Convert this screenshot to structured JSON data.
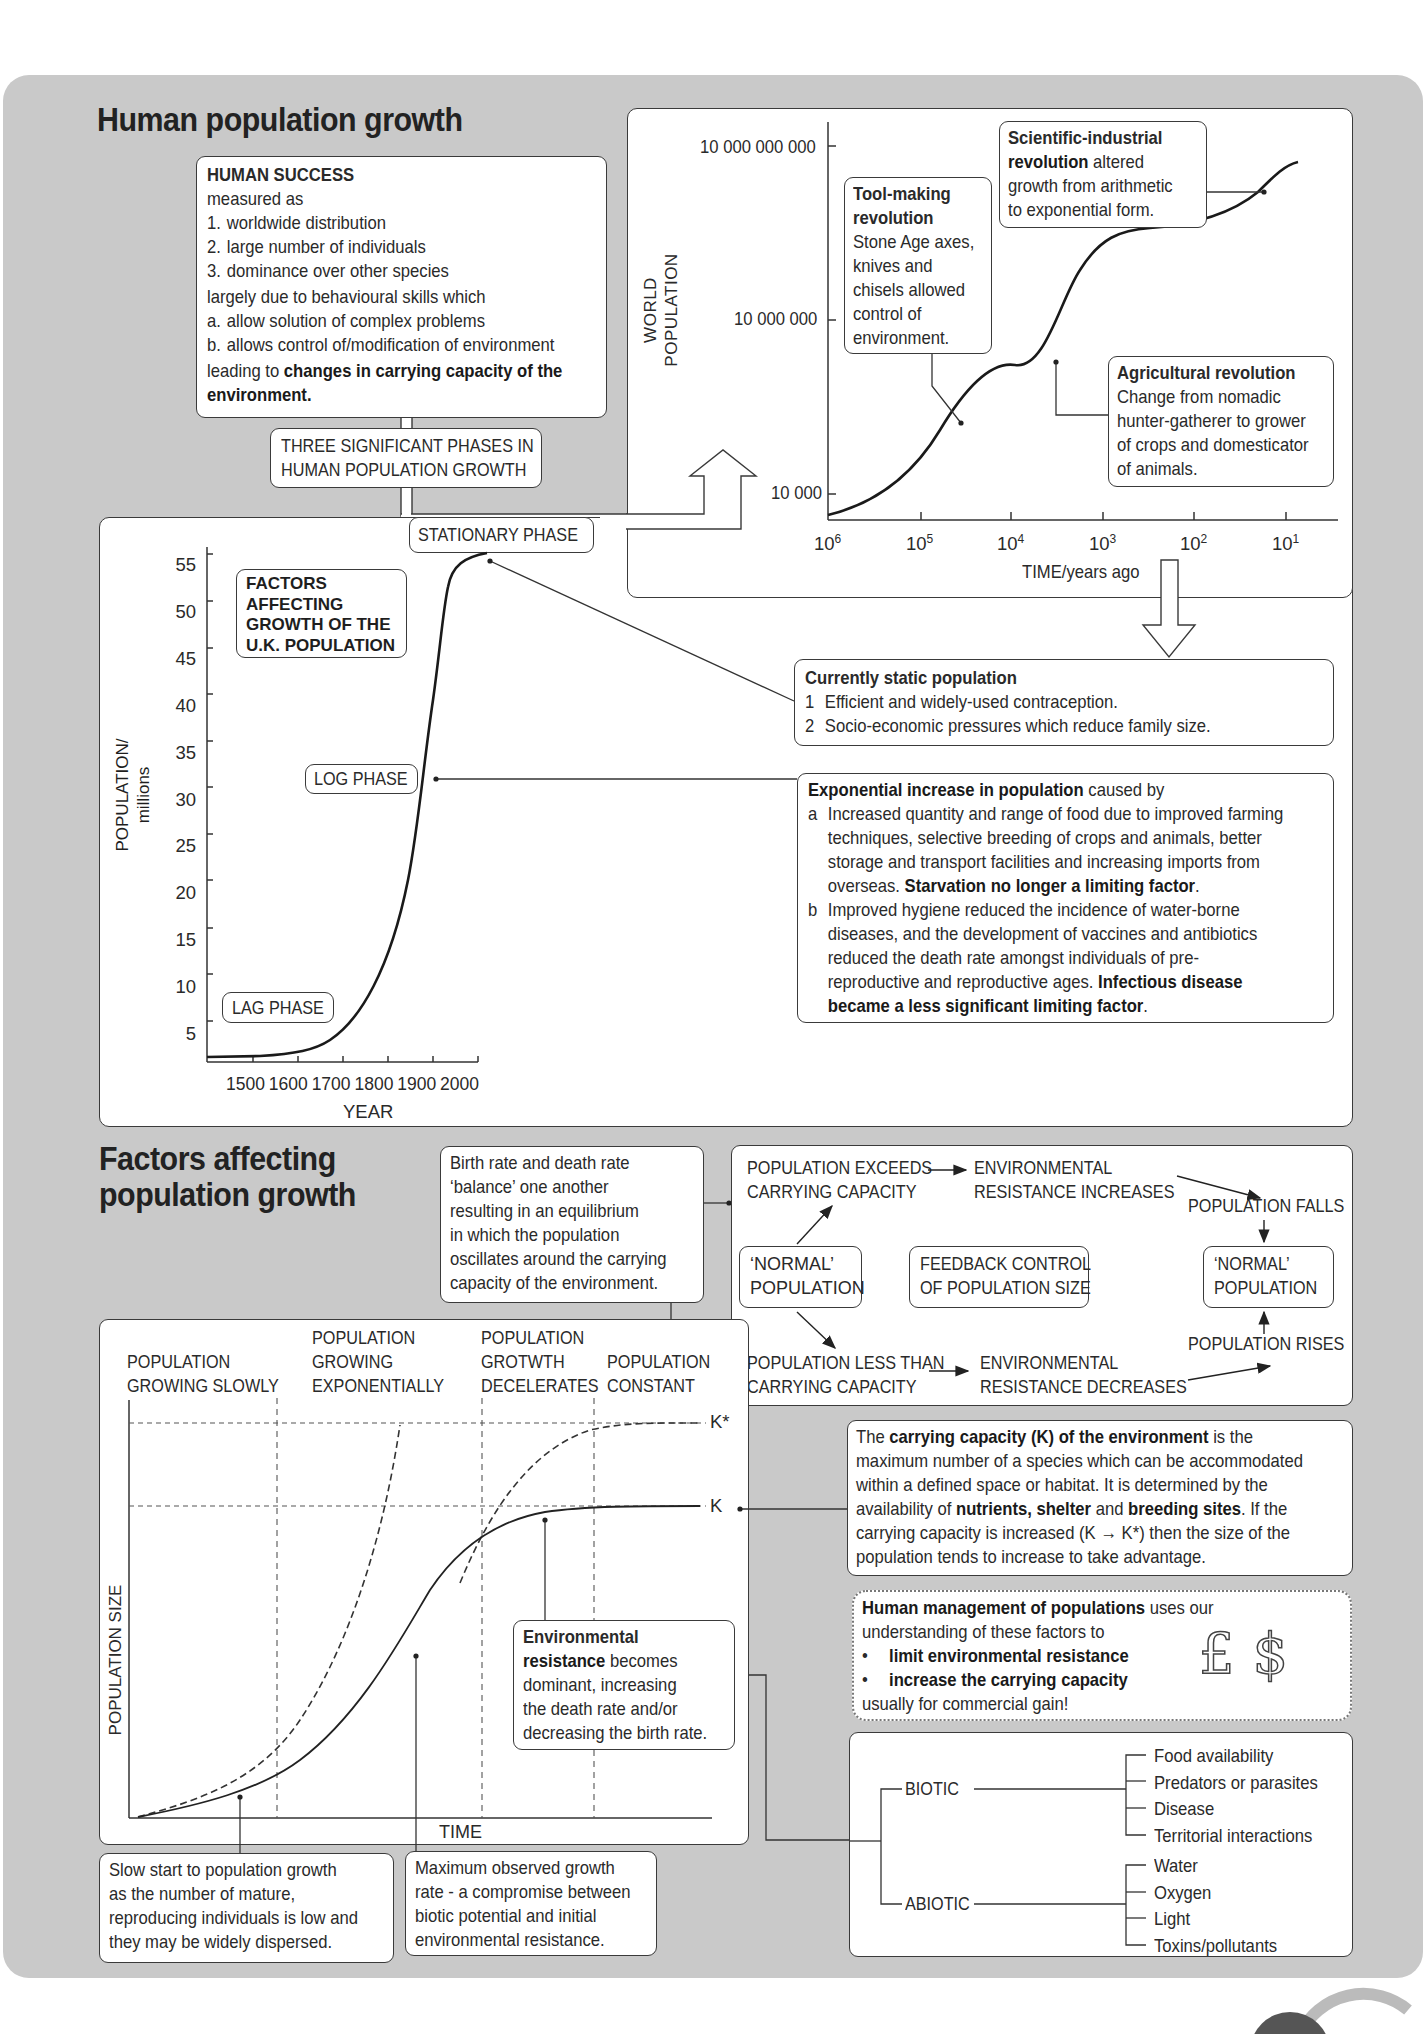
{
  "section1": {
    "title": "Human population growth",
    "human_success": {
      "heading": "HUMAN SUCCESS",
      "intro": "measured as",
      "measures": [
        {
          "key": "1.",
          "text": "worldwide distribution"
        },
        {
          "key": "2.",
          "text": "large number of individuals"
        },
        {
          "key": "3.",
          "text": "dominance over other species"
        }
      ],
      "due_to": "largely due to behavioural skills which",
      "skills": [
        {
          "key": "a.",
          "text": "allow solution of complex problems"
        },
        {
          "key": "b.",
          "text": "allows control of/modification of environment"
        }
      ],
      "leading_prefix": "leading to ",
      "leading_bold": "changes in carrying capacity of the environment."
    },
    "three_phases": {
      "line1": "THREE SIGNIFICANT PHASES IN",
      "line2": "HUMAN POPULATION GROWTH"
    },
    "world_chart": {
      "ylabel_line1": "WORLD",
      "ylabel_line2": "POPULATION",
      "y_ticks": [
        "10 000 000 000",
        "10 000 000",
        "10 000"
      ],
      "x_ticks": [
        {
          "base": "10",
          "exp": "6"
        },
        {
          "base": "10",
          "exp": "5"
        },
        {
          "base": "10",
          "exp": "4"
        },
        {
          "base": "10",
          "exp": "3"
        },
        {
          "base": "10",
          "exp": "2"
        },
        {
          "base": "10",
          "exp": "1"
        }
      ],
      "xlabel": "TIME/years ago",
      "annotations": {
        "tool_making": {
          "bold": "Tool-making revolution",
          "bold_l1": "Tool-making",
          "bold_l2": "revolution",
          "lines": [
            "Stone Age axes,",
            "knives and",
            "chisels allowed",
            "control of",
            "environment."
          ]
        },
        "scientific": {
          "bold_l1": "Scientific-industrial",
          "bold_l2": "revolution",
          "rest_l2": " altered",
          "lines": [
            "growth from arithmetic",
            "to exponential form."
          ]
        },
        "agricultural": {
          "bold": "Agricultural revolution",
          "lines": [
            "Change from nomadic",
            "hunter-gatherer to grower",
            "of crops and domesticator",
            "of animals."
          ]
        }
      }
    },
    "uk_chart": {
      "title_lines": [
        "FACTORS",
        "AFFECTING",
        "GROWTH OF THE",
        "U.K. POPULATION"
      ],
      "ylabel_line1": "POPULATION/",
      "ylabel_line2": "millions",
      "y_ticks": [
        "55",
        "50",
        "45",
        "40",
        "35",
        "30",
        "25",
        "20",
        "15",
        "10",
        "5"
      ],
      "x_ticks": [
        "1500",
        "1600",
        "1700",
        "1800",
        "1900",
        "2000"
      ],
      "xlabel": "YEAR",
      "phase_labels": {
        "stationary": "STATIONARY PHASE",
        "log": "LOG PHASE",
        "lag": "LAG PHASE"
      }
    },
    "static_box": {
      "heading": "Currently static population",
      "items": [
        {
          "key": "1",
          "text": "Efficient and widely-used contraception."
        },
        {
          "key": "2",
          "text": "Socio-economic pressures which reduce family size."
        }
      ]
    },
    "exponential_box": {
      "heading_bold": "Exponential increase in population",
      "heading_rest": " caused by",
      "item_a_key": "a",
      "item_a_lines": [
        "Increased quantity and range of food due to improved farming",
        "techniques, selective breeding of crops and animals, better",
        "storage and transport facilities and increasing imports from"
      ],
      "item_a_last_plain": "overseas. ",
      "item_a_last_bold": "Starvation no longer a limiting factor",
      "item_b_key": "b",
      "item_b_lines": [
        "Improved hygiene reduced the incidence of water-borne",
        "diseases, and the development of vaccines and antibiotics",
        "reduced the death rate amongst individuals of pre-"
      ],
      "item_b_l4_plain": "reproductive and reproductive ages. ",
      "item_b_l4_bold": "Infectious disease",
      "item_b_l5_bold": "became a less significant limiting factor",
      "period": "."
    }
  },
  "section2": {
    "title_line1": "Factors affecting",
    "title_line2": "population growth",
    "birth_death_box": {
      "lines": [
        "Birth rate and death rate",
        "‘balance’ one another",
        "resulting in an equilibrium",
        "in which the population",
        "oscillates around the carrying",
        "capacity of the environment."
      ]
    },
    "feedback": {
      "exceeds": [
        "POPULATION EXCEEDS",
        "CARRYING CAPACITY"
      ],
      "res_increases": [
        "ENVIRONMENTAL",
        "RESISTANCE INCREASES"
      ],
      "falls": "POPULATION FALLS",
      "normal_left": [
        "‘NORMAL’",
        "POPULATION"
      ],
      "center": [
        "FEEDBACK CONTROL",
        "OF POPULATION SIZE"
      ],
      "normal_right": [
        "‘NORMAL’",
        "POPULATION"
      ],
      "rises": "POPULATION RISES",
      "less_than": [
        "POPULATION LESS THAN",
        "CARRYING CAPACITY"
      ],
      "res_decreases": [
        "ENVIRONMENTAL",
        "RESISTANCE DECREASES"
      ]
    },
    "logistic_chart": {
      "phases": [
        {
          "lines": [
            "POPULATION",
            "GROWING SLOWLY"
          ]
        },
        {
          "lines": [
            "POPULATION",
            "GROWING",
            "EXPONENTIALLY"
          ]
        },
        {
          "lines": [
            "POPULATION",
            "GROTWTH",
            "DECELERATES"
          ]
        },
        {
          "lines": [
            "POPULATION",
            "CONSTANT"
          ]
        }
      ],
      "ylabel": "POPULATION SIZE",
      "xlabel": "TIME",
      "k_label": "K",
      "kstar_label": "K*",
      "env_resistance": {
        "bold_l1": "Environmental",
        "bold_l2": "resistance",
        "rest_l2": " becomes",
        "lines": [
          "dominant, increasing",
          "the death rate and/or",
          "decreasing the birth rate."
        ]
      }
    },
    "carrying_capacity": {
      "l1_plain": "The ",
      "l1_bold": "carrying capacity (K) of the environment",
      "l1_rest": " is the",
      "l2": "maximum number of a species which can be accommodated",
      "l3": "within a defined space or habitat. It is determined by the",
      "l4_plain1": "availability of ",
      "l4_bold1": "nutrients, shelter",
      "l4_plain2": " and ",
      "l4_bold2": "breeding sites",
      "l4_rest": ". If the",
      "l5": "carrying capacity is increased (K → K*) then the size of the",
      "l6": "population tends to increase to take advantage."
    },
    "human_management": {
      "bold": "Human management of populations",
      "rest": " uses our",
      "l2": "understanding of these factors to",
      "bullets": [
        "limit environmental resistance",
        "increase the carrying capacity"
      ],
      "l5": "usually for commercial gain!",
      "currency": [
        "£",
        "$"
      ]
    },
    "factors_tree": {
      "biotic": {
        "label": "BIOTIC",
        "items": [
          "Food availability",
          "Predators or parasites",
          "Disease",
          "Territorial interactions"
        ]
      },
      "abiotic": {
        "label": "ABIOTIC",
        "items": [
          "Water",
          "Oxygen",
          "Light",
          "Toxins/pollutants"
        ]
      }
    },
    "slow_start": {
      "lines": [
        "Slow start to population growth",
        "as the number of mature,",
        "reproducing individuals is low and",
        "they may be widely dispersed."
      ]
    },
    "max_growth": {
      "lines": [
        "Maximum observed growth",
        "rate - a compromise between",
        "biotic potential and initial",
        "environmental resistance."
      ]
    }
  },
  "colors": {
    "panel": "#c9c9c9",
    "box": "#ffffff",
    "stroke": "#3a3a3a",
    "text": "#1e1e1e"
  }
}
